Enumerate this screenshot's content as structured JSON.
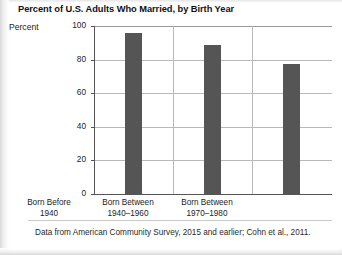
{
  "figure": {
    "title": "Percent of U.S. Adults Who Married, by Birth Year",
    "footnote": "Data from American Community Survey, 2015 and earlier; Cohn et al., 2011."
  },
  "axes": {
    "y_axis_label": "Percent",
    "y_ticks": [
      "0",
      "20",
      "40",
      "60",
      "80",
      "100"
    ]
  },
  "categories": [
    {
      "line1": "Born Before",
      "line2": "1940"
    },
    {
      "line1": "Born Between",
      "line2": "1940–1960"
    },
    {
      "line1": "Born Between",
      "line2": "1970–1980"
    }
  ],
  "colors": {
    "bar": "#555555",
    "gridline": "#b9b9b9",
    "axis": "#555555",
    "text": "#1c1c1c",
    "background": "#ffffff"
  },
  "chart_data": {
    "type": "bar",
    "title": "Percent of U.S. Adults Who Married, by Birth Year",
    "xlabel": "",
    "ylabel": "Percent",
    "ylim": [
      0,
      100
    ],
    "yticks": [
      0,
      20,
      40,
      60,
      80,
      100
    ],
    "grid": "horizontal",
    "legend": "none",
    "categories": [
      "Born Before 1940",
      "Born Between 1940–1960",
      "Born Between 1970–1980"
    ],
    "values": [
      96,
      88.5,
      77.5
    ],
    "annotation": "Data from American Community Survey, 2015 and earlier; Cohn et al., 2011."
  }
}
